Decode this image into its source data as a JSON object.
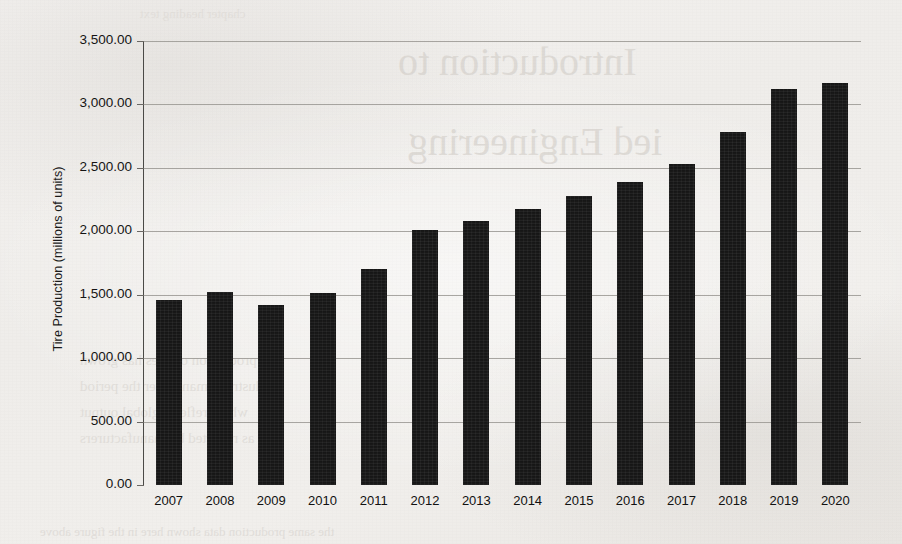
{
  "chart_data": {
    "type": "bar",
    "title": "",
    "xlabel": "",
    "ylabel": "Tire Production (millions of units)",
    "categories": [
      "2007",
      "2008",
      "2009",
      "2010",
      "2011",
      "2012",
      "2013",
      "2014",
      "2015",
      "2016",
      "2017",
      "2018",
      "2019",
      "2020"
    ],
    "values": [
      1460,
      1525,
      1420,
      1510,
      1705,
      2010,
      2085,
      2175,
      2280,
      2390,
      2530,
      2780,
      3120,
      3170
    ],
    "ylim": [
      0,
      3500
    ],
    "ytick_values": [
      0,
      500,
      1000,
      1500,
      2000,
      2500,
      3000,
      3500
    ],
    "ytick_labels": [
      "0.00",
      "500.00",
      "1,000.00",
      "1,500.00",
      "2,000.00",
      "2,500.00",
      "3,000.00",
      "3,500.00"
    ],
    "grid": true,
    "legend": "none",
    "series_color": "#161616",
    "grid_color": "#9a9893",
    "axis_color": "#4a4946"
  },
  "page": {
    "background_color": "#f2f0ee",
    "ghost_text": {
      "title_line_1": "Introduction to",
      "title_line_2": "ied Engineering",
      "body_line_1": "the production of tires has grown",
      "body_line_2": "industry demand over the period",
      "body_line_3": "which reflects global output",
      "body_line_4": "as reported by manufacturers",
      "footer": "the same production data shown here in the figure above",
      "top": "chapter heading text"
    }
  }
}
